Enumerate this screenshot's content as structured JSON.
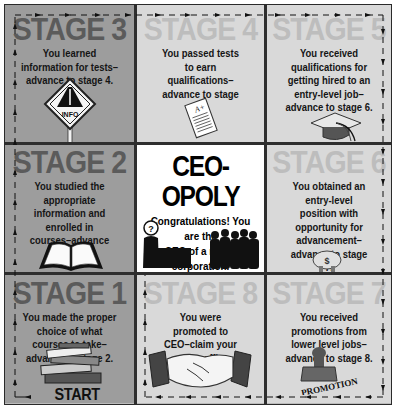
{
  "board": {
    "title": "CEO-OPOLY",
    "center_text": "Congratulations! You are the CEO of a major corporation.",
    "center_text_line1": "Congratulations! You are the",
    "center_text_line2": "CEO of a major corporation.",
    "start_label": "START HERE",
    "colors": {
      "dark_cell": "#9d9d9d",
      "light_cell": "#d9d9d9",
      "center_cell": "#ffffff",
      "grid_line": "#2e2e2e",
      "dark_title": "#5b5b5b",
      "light_title": "#bdbdbd"
    },
    "stages": {
      "s3": {
        "title": "STAGE 3",
        "text": "You learned information for tests–advance to stage 4.",
        "icon": "info-road-sign-icon",
        "icon_label": "INFO"
      },
      "s4": {
        "title": "STAGE 4",
        "text": "You passed tests to earn qualifications–advance to stage 5.",
        "icon": "graded-test-paper-icon",
        "icon_label": "A+"
      },
      "s5": {
        "title": "STAGE 5",
        "text": "You received qualifications for getting hired to an entry-level job–advance to stage 6.",
        "icon": "graduation-cap-icon"
      },
      "s2": {
        "title": "STAGE 2",
        "text": "You studied the appropriate information and enrolled in courses–advance to stage 3.",
        "icon": "open-book-icon"
      },
      "s6": {
        "title": "STAGE 6",
        "text": "You obtained an entry-level position with opportunity for advancement–advance to stage 7.",
        "icon": "piggy-bank-icon",
        "icon_label": "$"
      },
      "s1": {
        "title": "STAGE 1",
        "text": "You made the proper choice of what courses to take–advance to stage 2.",
        "icon": "stack-of-books-icon"
      },
      "s8": {
        "title": "STAGE 8",
        "text": "You were promoted to CEO–claim your center office suite!",
        "icon": "handshake-icon"
      },
      "s7": {
        "title": "STAGE 7",
        "text": "You received promotions from lower level jobs–advance to stage 8.",
        "icon": "promotion-stamp-icon",
        "icon_label": "PROMOTION"
      }
    },
    "center_icons": {
      "ceo_label": "?"
    }
  }
}
